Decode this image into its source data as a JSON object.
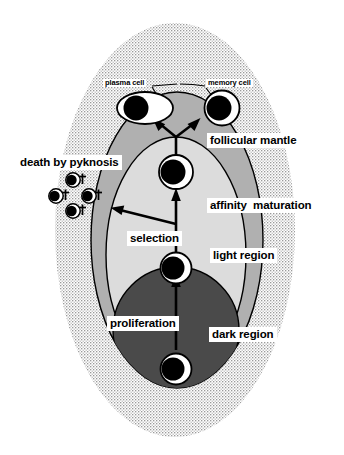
{
  "figure": {
    "labels": {
      "plasma_cell": "plasma cell",
      "memory_cell": "memory cell",
      "follicular_mantle": "follicular mantle",
      "death_by_pyknosis": "death by pyknosis",
      "affinity_maturation": "affinity  maturation",
      "selection": "selection",
      "light_region": "light region",
      "proliferation": "proliferation",
      "dark_region": "dark region"
    },
    "colors": {
      "stipple_background": "#e8e8e8",
      "follicular_mantle_fill": "#b0b0b0",
      "light_region_fill": "#dcdcdc",
      "dark_region_fill": "#4a4a4a",
      "cell_nucleus": "#000000",
      "cell_cytoplasm": "#ffffff",
      "outline": "#000000",
      "label_background": "#ffffff",
      "label_text": "#000000"
    },
    "cells": {
      "plasma_cell_shape": "oval-cell-with-eccentric-nucleus",
      "memory_cell_shape": "round-cell-with-nucleus",
      "centrocyte_upper": "round-cell-with-nucleus",
      "centrocyte_lower": "round-cell-with-nucleus",
      "centroblast": "round-cell-with-nucleus",
      "apoptotic_cell_count": 4,
      "apoptotic_marker": "†"
    },
    "arrows": {
      "branching": "Y-shaped arrow to plasma cell and memory cell",
      "affinity_maturation": "upward arrow",
      "proliferation": "upward arrow",
      "selection": "leftward arrow to apoptotic cells"
    }
  }
}
